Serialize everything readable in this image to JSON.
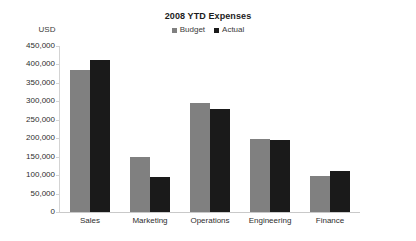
{
  "chart_data": {
    "type": "bar",
    "title": "2008 YTD Expenses",
    "xlabel": "",
    "ylabel": "USD",
    "ylim": [
      0,
      450000
    ],
    "ytick_labels": [
      "450,000",
      "400,000",
      "350,000",
      "300,000",
      "250,000",
      "200,000",
      "150,000",
      "100,000",
      "50,000",
      "0"
    ],
    "ytick_values": [
      450000,
      400000,
      350000,
      300000,
      250000,
      200000,
      150000,
      100000,
      50000,
      0
    ],
    "grid": false,
    "legend_position": "top-center",
    "categories": [
      "Sales",
      "Marketing",
      "Operations",
      "Engineering",
      "Finance"
    ],
    "series": [
      {
        "name": "Budget",
        "color": "#808080",
        "values": [
          385000,
          149000,
          295000,
          198000,
          98000
        ]
      },
      {
        "name": "Actual",
        "color": "#1a1a1a",
        "values": [
          412000,
          95000,
          280000,
          195000,
          110000
        ]
      }
    ]
  }
}
